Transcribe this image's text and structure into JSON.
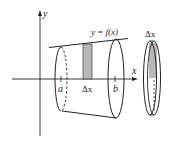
{
  "figure": {
    "axes": {
      "x_label": "x",
      "y_label": "y"
    },
    "curve_label": "y = f(x)",
    "interval": {
      "a_label": "a",
      "b_label": "b"
    },
    "strip_label": "Δx",
    "disk_label": "Δx",
    "colors": {
      "stroke": "#222222",
      "shading": "#b8b8b8",
      "background": "#ffffff"
    }
  }
}
